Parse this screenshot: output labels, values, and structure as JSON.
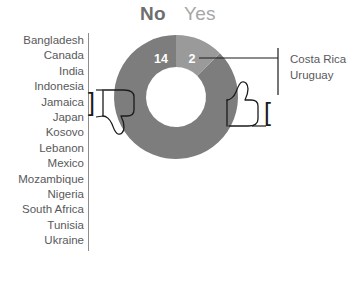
{
  "chart_data": {
    "type": "pie",
    "title": "",
    "legend_position": "top-center",
    "labels": [
      "No",
      "Yes"
    ],
    "values": [
      14,
      2
    ],
    "total": 16,
    "colors": [
      "#7d7d7d",
      "#9a9a9a"
    ],
    "inner_radius_ratio": 0.52,
    "start_angle_deg": 0,
    "direction": "clockwise",
    "annotations": [
      {
        "slice": "No",
        "value": 14,
        "icon": "thumbs-down-icon",
        "members": [
          "Bangladesh",
          "Canada",
          "India",
          "Indonesia",
          "Jamaica",
          "Japan",
          "Kosovo",
          "Lebanon",
          "Mexico",
          "Mozambique",
          "Nigeria",
          "South Africa",
          "Tunisia",
          "Ukraine"
        ]
      },
      {
        "slice": "Yes",
        "value": 2,
        "icon": "thumbs-up-icon",
        "members": [
          "Costa Rica",
          "Uruguay"
        ]
      }
    ]
  },
  "titles": {
    "no": "No",
    "yes": "Yes"
  },
  "segments": {
    "no_value": "14",
    "yes_value": "2"
  },
  "left_list": {
    "items": [
      "Bangladesh",
      "Canada",
      "India",
      "Indonesia",
      "Jamaica",
      "Japan",
      "Kosovo",
      "Lebanon",
      "Mexico",
      "Mozambique",
      "Nigeria",
      "South Africa",
      "Tunisia",
      "Ukraine"
    ]
  },
  "right_list": {
    "items": [
      "Costa Rica",
      "Uruguay"
    ]
  },
  "brackets": {
    "left_glyph": "]",
    "right_glyph": "["
  },
  "colors": {
    "no_slice": "#7d7d7d",
    "yes_slice": "#9a9a9a",
    "text": "#59595b",
    "title_no": "#6e6e6e",
    "title_yes": "#a6a6a6",
    "ink": "#1b1b1b",
    "rule": "#8d8d8d",
    "background": "#ffffff"
  }
}
